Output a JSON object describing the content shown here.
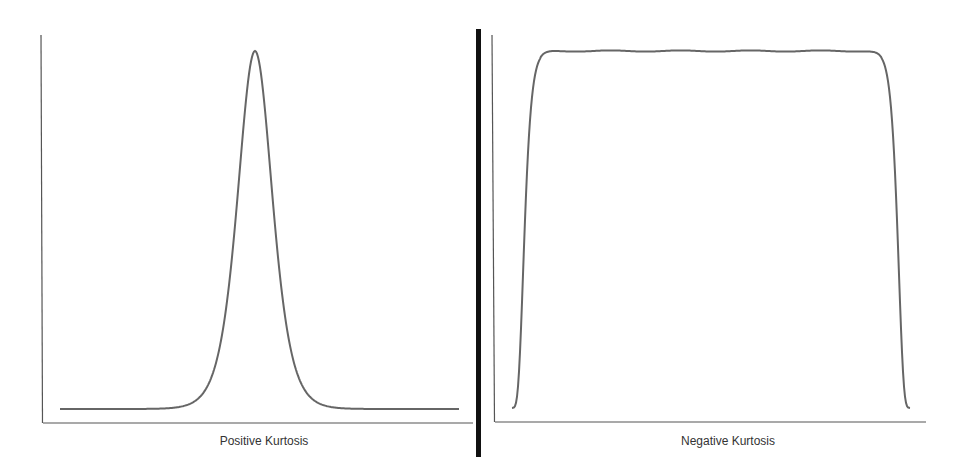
{
  "colors": {
    "background": "#ffffff",
    "axis": "#555555",
    "curve": "#666666",
    "divider": "#111111",
    "label": "#333333"
  },
  "chart_data": [
    {
      "type": "line",
      "title": "Positive Kurtosis",
      "xlabel": "Positive Kurtosis",
      "ylabel": "",
      "grid": false,
      "legend": "none",
      "description": "Leptokurtic distribution: tall narrow peak with heavy tails",
      "x": [
        -6,
        -5,
        -4,
        -3,
        -2.5,
        -2,
        -1.5,
        -1,
        -0.5,
        0,
        0.5,
        1,
        1.5,
        2,
        2.5,
        3,
        4,
        5,
        6
      ],
      "values": [
        0.0,
        0.002,
        0.006,
        0.02,
        0.045,
        0.1,
        0.22,
        0.46,
        0.82,
        1.0,
        0.82,
        0.46,
        0.22,
        0.1,
        0.045,
        0.02,
        0.006,
        0.002,
        0.0
      ],
      "ylim": [
        0,
        1.05
      ]
    },
    {
      "type": "line",
      "title": "Negative Kurtosis",
      "xlabel": "Negative Kurtosis",
      "ylabel": "",
      "grid": false,
      "legend": "none",
      "description": "Platykurtic distribution: flat top with steep sides, nearly uniform",
      "x": [
        -1.0,
        -0.98,
        -0.95,
        -0.9,
        -0.5,
        0,
        0.5,
        0.9,
        0.95,
        0.98,
        1.0
      ],
      "values": [
        0.0,
        0.5,
        0.95,
        1.0,
        1.0,
        1.0,
        1.0,
        1.0,
        0.95,
        0.5,
        0.0
      ],
      "ylim": [
        0,
        1.05
      ]
    }
  ],
  "labels": {
    "left": "Positive Kurtosis",
    "right": "Negative Kurtosis"
  }
}
